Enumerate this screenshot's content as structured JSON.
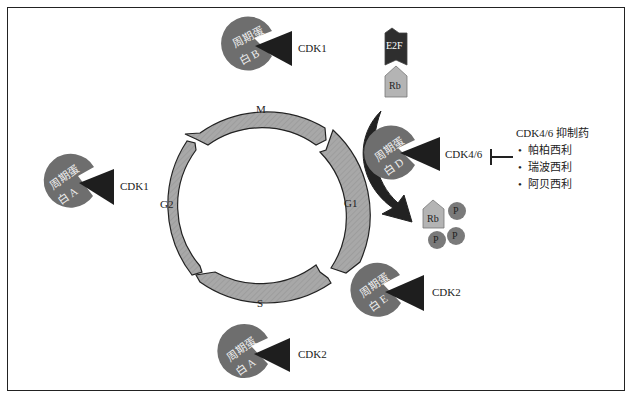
{
  "diagram": {
    "title": "",
    "phases": [
      {
        "id": "M",
        "label": "M"
      },
      {
        "id": "G1",
        "label": "G1"
      },
      {
        "id": "S",
        "label": "S"
      },
      {
        "id": "G2",
        "label": "G2"
      }
    ],
    "complexes": [
      {
        "id": "cyclin-b-cdk1",
        "cyclin_line1": "周期蛋",
        "cyclin_line2": "白 B",
        "cdk": "CDK1"
      },
      {
        "id": "cyclin-a-cdk1",
        "cyclin_line1": "周期蛋",
        "cyclin_line2": "白 A",
        "cdk": "CDK1"
      },
      {
        "id": "cyclin-d-cdk46",
        "cyclin_line1": "周期蛋",
        "cyclin_line2": "白 D",
        "cdk": "CDK4/6"
      },
      {
        "id": "cyclin-e-cdk2",
        "cyclin_line1": "周期蛋",
        "cyclin_line2": "白 E",
        "cdk": "CDK2"
      },
      {
        "id": "cyclin-a-cdk2",
        "cyclin_line1": "周期蛋",
        "cyclin_line2": "白 A",
        "cdk": "CDK2"
      }
    ],
    "e2f": "E2F",
    "rb": "Rb",
    "phospho_rb": {
      "label": "Rb",
      "phosphates": [
        "P",
        "P",
        "P"
      ]
    },
    "inhibitors": {
      "title": "CDK4/6 抑制药",
      "items": [
        "帕柏西利",
        "瑞波西利",
        "阿贝西利"
      ]
    },
    "colors": {
      "cyclin": "#6e6e6e",
      "cdk": "#1e1e1e",
      "phase_arrow": "#a8a8a8",
      "e2f": "#2e2e2e",
      "rb": "#b4b4b4",
      "phosphate": "#7a7a7a",
      "outline": "#222222"
    }
  }
}
